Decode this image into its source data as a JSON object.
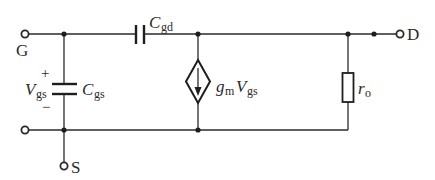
{
  "diagram": {
    "type": "small-signal equivalent circuit",
    "terminals": {
      "gate": {
        "label": "G"
      },
      "drain": {
        "label": "D"
      },
      "source": {
        "label": "S"
      }
    },
    "components": {
      "cgd": {
        "symbol": "C",
        "subscript": "gd"
      },
      "cgs": {
        "symbol": "C",
        "subscript": "gs"
      },
      "vgs": {
        "symbol": "V",
        "subscript": "gs",
        "plus": "+",
        "minus": "−"
      },
      "current_source": {
        "gm": "g",
        "gm_sub": "m",
        "v": "V",
        "v_sub": "gs",
        "arrow": "down"
      },
      "ro": {
        "symbol": "r",
        "subscript": "o"
      }
    },
    "colors": {
      "ink": "#2a2a2a",
      "background": "#ffffff"
    }
  }
}
